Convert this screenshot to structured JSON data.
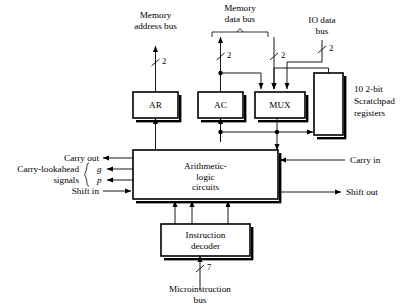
{
  "figure": {
    "background_color": "#ffffff",
    "line_color": "#000000"
  },
  "blocks": {
    "ar": {
      "label": "AR",
      "x": 133,
      "y": 92,
      "w": 45,
      "h": 26
    },
    "ac": {
      "label": "AC",
      "x": 198,
      "y": 92,
      "w": 45,
      "h": 26
    },
    "mux": {
      "label": "MUX",
      "x": 255,
      "y": 92,
      "w": 50,
      "h": 26
    },
    "scratchpad": {
      "label": "",
      "x": 314,
      "y": 73,
      "w": 29,
      "h": 62
    },
    "alu": {
      "label_line1": "Arithmetic-",
      "label_line2": "logic",
      "label_line3": "circuits",
      "x": 133,
      "y": 150,
      "w": 145,
      "h": 49
    },
    "decoder": {
      "label_line1": "Instruction",
      "label_line2": "decoder",
      "x": 161,
      "y": 224,
      "w": 89,
      "h": 32
    }
  },
  "labels": {
    "memory_address_bus_line1": "Memory",
    "memory_address_bus_line2": "address bus",
    "memory_data_bus_line1": "Memory",
    "memory_data_bus_line2": "data bus",
    "io_data_bus_line1": "IO data",
    "io_data_bus_line2": "bus",
    "scratchpad_line1": "10 2-bit",
    "scratchpad_line2": "Scratchpad",
    "scratchpad_line3": "registers",
    "carry_out": "Carry out",
    "carry_lookahead": "Carry-lookahead",
    "signals": "signals",
    "signal_g": "g",
    "signal_p": "p",
    "shift_in": "Shift in",
    "carry_in": "Carry in",
    "shift_out": "Shift out",
    "microinstruction_bus_line1": "Microinstruction",
    "microinstruction_bus_line2": "bus"
  },
  "bus_widths": {
    "memory_address_bus": "2",
    "memory_data_bus_ac": "2",
    "memory_data_bus_mux": "2",
    "io_data_bus": "2",
    "microinstruction_bus": "7"
  }
}
